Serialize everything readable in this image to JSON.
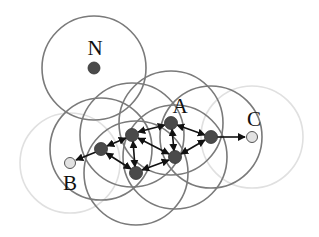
{
  "diagram": {
    "type": "network-range-graph",
    "colors": {
      "range_dark": "#7a7a7a",
      "range_faint": "#e0e0e0",
      "node_dark": "#4a4a4a",
      "node_light": "#e2e2e2",
      "edge": "#111111"
    },
    "labels": {
      "N": "N",
      "A": "A",
      "B": "B",
      "C": "C"
    },
    "nodes": [
      {
        "id": "N",
        "label": "N",
        "x": 94,
        "y": 68,
        "style": "dark",
        "range": "dark"
      },
      {
        "id": "A",
        "label": "A",
        "x": 171,
        "y": 123,
        "style": "dark",
        "range": "dark"
      },
      {
        "id": "R",
        "label": "",
        "x": 211,
        "y": 137,
        "style": "dark",
        "range": "dark"
      },
      {
        "id": "C",
        "label": "C",
        "x": 252,
        "y": 137,
        "style": "light",
        "range": "faint"
      },
      {
        "id": "n2",
        "label": "",
        "x": 132,
        "y": 135,
        "style": "dark",
        "range": "dark"
      },
      {
        "id": "n1",
        "label": "",
        "x": 101,
        "y": 149,
        "style": "dark",
        "range": "dark"
      },
      {
        "id": "n5",
        "label": "",
        "x": 175,
        "y": 157,
        "style": "dark",
        "range": "dark"
      },
      {
        "id": "n4",
        "label": "",
        "x": 136,
        "y": 173,
        "style": "dark",
        "range": "dark"
      },
      {
        "id": "B",
        "label": "B",
        "x": 70,
        "y": 163,
        "style": "light",
        "range": "faint"
      }
    ],
    "edges": [
      {
        "from": "n1",
        "to": "B",
        "directed": "one-way"
      },
      {
        "from": "n1",
        "to": "n2",
        "directed": "both"
      },
      {
        "from": "n1",
        "to": "n4",
        "directed": "both"
      },
      {
        "from": "n2",
        "to": "A",
        "directed": "both"
      },
      {
        "from": "n2",
        "to": "n4",
        "directed": "both"
      },
      {
        "from": "n2",
        "to": "n5",
        "directed": "both"
      },
      {
        "from": "A",
        "to": "n5",
        "directed": "both"
      },
      {
        "from": "A",
        "to": "R",
        "directed": "both"
      },
      {
        "from": "n4",
        "to": "n5",
        "directed": "both"
      },
      {
        "from": "n5",
        "to": "R",
        "directed": "both"
      },
      {
        "from": "R",
        "to": "C",
        "directed": "one-way"
      }
    ]
  }
}
